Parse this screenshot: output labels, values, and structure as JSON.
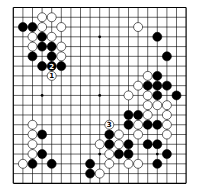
{
  "diagram": {
    "type": "go-board",
    "size": 19,
    "colors": {
      "background": "#ffffff",
      "line": "#000000",
      "black": "#000000",
      "white": "#ffffff"
    },
    "star_points": [
      [
        3,
        3
      ],
      [
        9,
        3
      ],
      [
        15,
        3
      ],
      [
        3,
        9
      ],
      [
        9,
        9
      ],
      [
        15,
        9
      ],
      [
        3,
        15
      ],
      [
        9,
        15
      ],
      [
        15,
        15
      ]
    ],
    "stones": {
      "black": [
        [
          1,
          2
        ],
        [
          2,
          2
        ],
        [
          3,
          3
        ],
        [
          3,
          4
        ],
        [
          4,
          4
        ],
        [
          2,
          5
        ],
        [
          4,
          5
        ],
        [
          3,
          6
        ],
        [
          4,
          6
        ],
        [
          5,
          6
        ],
        [
          15,
          3
        ],
        [
          16,
          5
        ],
        [
          15,
          7
        ],
        [
          14,
          8
        ],
        [
          15,
          8
        ],
        [
          16,
          8
        ],
        [
          15,
          9
        ],
        [
          17,
          9
        ],
        [
          12,
          11
        ],
        [
          13,
          11
        ],
        [
          12,
          12
        ],
        [
          14,
          12
        ],
        [
          15,
          12
        ],
        [
          10,
          13
        ],
        [
          10,
          14
        ],
        [
          12,
          14
        ],
        [
          14,
          14
        ],
        [
          15,
          14
        ],
        [
          11,
          15
        ],
        [
          12,
          15
        ],
        [
          16,
          15
        ],
        [
          15,
          16
        ],
        [
          3,
          13
        ],
        [
          3,
          15
        ],
        [
          2,
          16
        ],
        [
          4,
          16
        ],
        [
          8,
          16
        ],
        [
          8,
          17
        ]
      ],
      "white": [
        [
          3,
          1
        ],
        [
          4,
          1
        ],
        [
          3,
          2
        ],
        [
          5,
          2
        ],
        [
          2,
          3
        ],
        [
          4,
          3
        ],
        [
          2,
          4
        ],
        [
          5,
          4
        ],
        [
          5,
          5
        ],
        [
          4,
          7
        ],
        [
          13,
          2
        ],
        [
          14,
          7
        ],
        [
          13,
          8
        ],
        [
          12,
          9
        ],
        [
          14,
          9
        ],
        [
          14,
          10
        ],
        [
          15,
          10
        ],
        [
          16,
          10
        ],
        [
          14,
          11
        ],
        [
          16,
          11
        ],
        [
          10,
          12
        ],
        [
          13,
          12
        ],
        [
          16,
          12
        ],
        [
          11,
          13
        ],
        [
          13,
          13
        ],
        [
          16,
          13
        ],
        [
          9,
          14
        ],
        [
          11,
          14
        ],
        [
          10,
          15
        ],
        [
          10,
          16
        ],
        [
          12,
          16
        ],
        [
          13,
          16
        ],
        [
          9,
          17
        ],
        [
          2,
          12
        ],
        [
          2,
          13
        ],
        [
          2,
          14
        ],
        [
          2,
          15
        ],
        [
          1,
          16
        ]
      ]
    },
    "move_labels": [
      {
        "label": "1",
        "color": "white",
        "col": 4,
        "row": 7
      },
      {
        "label": "2",
        "color": "black",
        "col": 4,
        "row": 6
      },
      {
        "label": "3",
        "color": "white",
        "col": 10,
        "row": 12
      }
    ]
  }
}
